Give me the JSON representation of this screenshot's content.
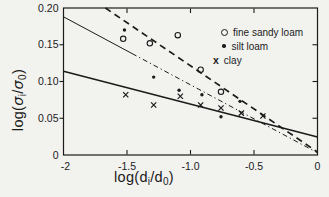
{
  "figure": {
    "background": "#f2f2ef",
    "ink": "#1b1b1b"
  },
  "chart_data": {
    "type": "scatter",
    "title": "",
    "xlabel_parts": {
      "p1": "log(d",
      "p2": "i",
      "p3": "/d",
      "p4": "0",
      "p5": ")"
    },
    "ylabel_parts": {
      "p1": "log(",
      "p2": "σ",
      "p3": "i",
      "p4": "/",
      "p5": "σ",
      "p6": "0",
      "p7": ")"
    },
    "xlim": [
      -2,
      0
    ],
    "ylim": [
      0,
      0.2
    ],
    "grid": false,
    "xticks": [
      {
        "v": -2,
        "label": "-2",
        "edge": true
      },
      {
        "v": -1.5,
        "label": "-1.5"
      },
      {
        "v": -1.0,
        "label": "-1.0"
      },
      {
        "v": -0.5,
        "label": "-0.5"
      },
      {
        "v": 0,
        "label": "0",
        "edge": true
      }
    ],
    "yticks": [
      {
        "v": 0,
        "label": "0",
        "edge": true
      },
      {
        "v": 0.05,
        "label": "0.05"
      },
      {
        "v": 0.1,
        "label": "0.10"
      },
      {
        "v": 0.15,
        "label": "0.15"
      },
      {
        "v": 0.2,
        "label": "0.20",
        "edge": true
      }
    ],
    "series": [
      {
        "name": "fine sandy loam",
        "marker": "open-circle",
        "points": [
          [
            -1.53,
            0.158
          ],
          [
            -1.32,
            0.152
          ],
          [
            -1.1,
            0.163
          ],
          [
            -0.92,
            0.116
          ],
          [
            -0.76,
            0.086
          ]
        ]
      },
      {
        "name": "silt loam",
        "marker": "filled-dot",
        "points": [
          [
            -1.52,
            0.17
          ],
          [
            -1.29,
            0.106
          ],
          [
            -1.09,
            0.088
          ],
          [
            -0.91,
            0.082
          ],
          [
            -0.76,
            0.052
          ],
          [
            -0.61,
            0.073
          ]
        ]
      },
      {
        "name": "clay",
        "marker": "x",
        "points": [
          [
            -1.51,
            0.082
          ],
          [
            -1.29,
            0.068
          ],
          [
            -1.08,
            0.08
          ],
          [
            -0.92,
            0.068
          ],
          [
            -0.76,
            0.064
          ],
          [
            -0.6,
            0.057
          ],
          [
            -0.43,
            0.053
          ]
        ]
      }
    ],
    "fit_lines": [
      {
        "name": "fine-sandy-loam-fit",
        "style": "dashed",
        "from": [
          -1.67,
          0.2
        ],
        "to": [
          0,
          0.004
        ]
      },
      {
        "name": "silt-loam-fit",
        "style": "solid-dashdot",
        "from": [
          -2.0,
          0.188
        ],
        "breakpoint": [
          -1.46,
          0.138
        ],
        "to": [
          0,
          0.003
        ]
      },
      {
        "name": "clay-fit",
        "style": "solid",
        "from": [
          -2.0,
          0.114
        ],
        "to": [
          0,
          0.0245
        ]
      }
    ],
    "legend": {
      "position": "top-right",
      "entries": [
        {
          "marker": "open-circle",
          "label": "fine sandy loam"
        },
        {
          "marker": "filled-dot",
          "label": "silt loam"
        },
        {
          "marker": "x",
          "marker_glyph": "x",
          "label": "clay"
        }
      ]
    }
  }
}
